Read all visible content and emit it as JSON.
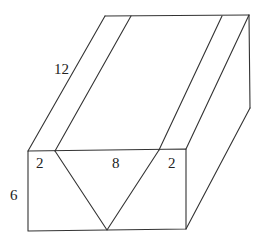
{
  "diagram": {
    "type": "3d-box-with-v-groove",
    "labels": {
      "length": "12",
      "left_margin": "2",
      "groove_width": "8",
      "right_margin": "2",
      "height": "6"
    },
    "colors": {
      "stroke": "#333333",
      "background": "#ffffff",
      "text": "#222222"
    }
  }
}
